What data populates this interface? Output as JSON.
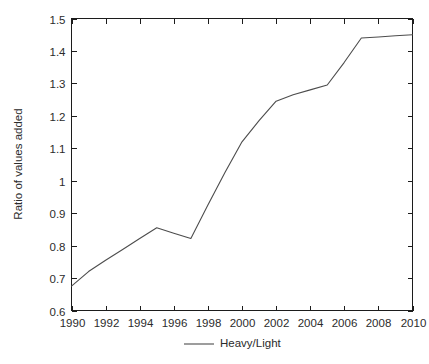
{
  "chart_data": {
    "type": "line",
    "title": "",
    "subtitle": "",
    "xlabel": "",
    "ylabel": "Ratio of values added",
    "xlim": [
      1990,
      2010
    ],
    "ylim": [
      0.6,
      1.5
    ],
    "grid": false,
    "legend_position": "bottom-center",
    "x": [
      1990,
      1991,
      1992,
      1993,
      1994,
      1995,
      1996,
      1997,
      1998,
      1999,
      2000,
      2001,
      2002,
      2003,
      2004,
      2005,
      2006,
      2007,
      2008,
      2009,
      2010
    ],
    "xticks": [
      1990,
      1992,
      1994,
      1996,
      1998,
      2000,
      2002,
      2004,
      2006,
      2008,
      2010
    ],
    "xtick_labels": [
      "1990",
      "1992",
      "1994",
      "1996",
      "1998",
      "2000",
      "2002",
      "2004",
      "2006",
      "2008",
      "2010"
    ],
    "yticks": [
      0.6,
      0.7,
      0.8,
      0.9,
      1.0,
      1.1,
      1.2,
      1.3,
      1.4,
      1.5
    ],
    "ytick_labels": [
      "0.6",
      "0.7",
      "0.8",
      "0.9",
      "1",
      "1.1",
      "1.2",
      "1.3",
      "1.4",
      "1.5"
    ],
    "series": [
      {
        "name": "Heavy/Light",
        "color": "#4d4d4d",
        "values": [
          0.675,
          0.72,
          0.755,
          0.788,
          0.822,
          0.855,
          0.838,
          0.822,
          0.925,
          1.025,
          1.12,
          1.185,
          1.245,
          1.265,
          1.28,
          1.295,
          1.365,
          1.44,
          1.443,
          1.447,
          1.45
        ]
      }
    ],
    "legend": [
      "Heavy/Light"
    ],
    "annotations": []
  }
}
